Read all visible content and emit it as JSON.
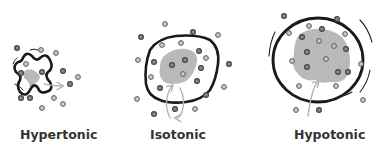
{
  "panels": [
    {
      "id": "hypertonic",
      "label": "Hypertonic",
      "cell_state": "shrunken",
      "water_flow": "out of cell"
    },
    {
      "id": "isotonic",
      "label": "Isotonic",
      "cell_state": "normal",
      "water_flow": "in and out equally"
    },
    {
      "id": "hypotonic",
      "label": "Hypotonic",
      "cell_state": "swollen",
      "water_flow": "into cell"
    }
  ],
  "colors": {
    "membrane": "#1a1a1a",
    "cytoplasm": "#b9b9b9",
    "arrow": "#b5b5b5",
    "solute": "#8a8a8a"
  }
}
